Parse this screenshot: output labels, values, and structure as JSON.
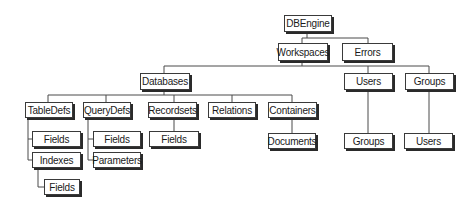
{
  "diagram": {
    "nodes": {
      "dbengine": "DBEngine",
      "workspaces": "Workspaces",
      "errors": "Errors",
      "databases": "Databases",
      "users": "Users",
      "groups": "Groups",
      "tabledefs": "TableDefs",
      "querydefs": "QueryDefs",
      "recordsets": "Recordsets",
      "relations": "Relations",
      "containers": "Containers",
      "users_groups": "Groups",
      "groups_users": "Users",
      "tabledefs_fields": "Fields",
      "tabledefs_indexes": "Indexes",
      "indexes_fields": "Fields",
      "querydefs_fields": "Fields",
      "querydefs_parameters": "Parameters",
      "recordsets_fields": "Fields",
      "containers_documents": "Documents"
    },
    "edges": [
      [
        "dbengine",
        "workspaces"
      ],
      [
        "dbengine",
        "errors"
      ],
      [
        "workspaces",
        "databases"
      ],
      [
        "workspaces",
        "users"
      ],
      [
        "workspaces",
        "groups"
      ],
      [
        "databases",
        "tabledefs"
      ],
      [
        "databases",
        "querydefs"
      ],
      [
        "databases",
        "recordsets"
      ],
      [
        "databases",
        "relations"
      ],
      [
        "databases",
        "containers"
      ],
      [
        "users",
        "users_groups"
      ],
      [
        "groups",
        "groups_users"
      ],
      [
        "tabledefs",
        "tabledefs_fields"
      ],
      [
        "tabledefs",
        "tabledefs_indexes"
      ],
      [
        "tabledefs_indexes",
        "indexes_fields"
      ],
      [
        "querydefs",
        "querydefs_fields"
      ],
      [
        "querydefs",
        "querydefs_parameters"
      ],
      [
        "recordsets",
        "recordsets_fields"
      ],
      [
        "containers",
        "containers_documents"
      ]
    ]
  }
}
